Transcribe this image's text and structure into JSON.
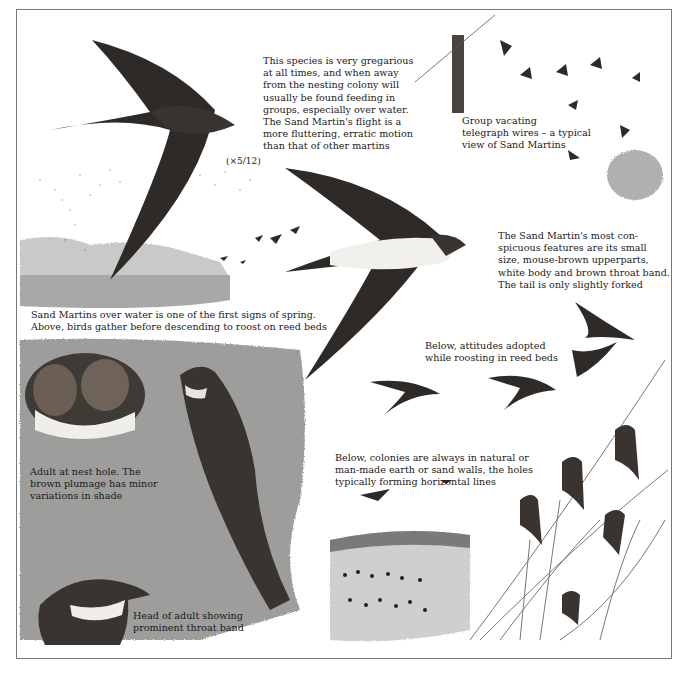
{
  "illustration": {
    "subject": "Sand Martin",
    "scale_label": "(×5/12)",
    "captions": {
      "gregarious": "This species is very gregarious\nat all times, and when away\nfrom the nesting colony will\nusually be found feeding in\ngroups, especially over water.\nThe Sand Martin's flight is a\nmore fluttering, erratic motion\nthan that of other martins",
      "telegraph": "Group vacating\ntelegraph wires – a typical\nview of Sand Martins",
      "features": "The Sand Martin's most con-\nspicuous features are its small\nsize, mouse-brown upperparts,\nwhite body and brown throat band.\nThe tail is only slightly forked",
      "over_water": "Sand Martins over water is one of the first signs of spring.\nAbove, birds gather before descending to roost on reed beds",
      "roosting": "Below, attitudes adopted\nwhile roosting in reed beds",
      "nest_hole": "Adult at nest hole. The\nbrown plumage has minor\nvariations in shade",
      "colonies": "Below, colonies are always in natural or\nman-made earth or sand walls, the holes\ntypically forming horizontal lines",
      "head": "Head of adult showing\nprominent throat band"
    },
    "colors": {
      "bird_dark": "#2e2a28",
      "bird_mid": "#4a4440",
      "belly": "#f2f0ec",
      "wash": "#9a9a98",
      "border": "#777777"
    }
  }
}
